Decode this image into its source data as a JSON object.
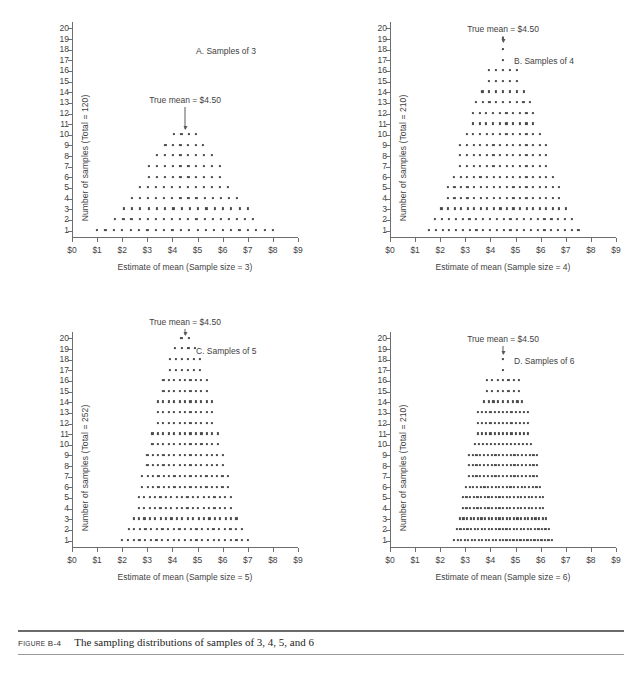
{
  "caption": {
    "figure_number_prefix": "F",
    "figure_number_small": "IGURE",
    "figure_number_id": " B-4",
    "text": "The sampling distributions of samples of 3, 4, 5, and 6"
  },
  "axes_common": {
    "ylabel_prefix": "Number of samples (Total = ",
    "ylabel_suffix": ")",
    "xlabel_prefix": "Estimate of mean (Sample size = ",
    "xlabel_suffix": ")",
    "x_tick_labels": [
      "$0",
      "$1",
      "$2",
      "$3",
      "$4",
      "$5",
      "$6",
      "$7",
      "$8",
      "$9"
    ],
    "y_tick_labels": [
      "1",
      "2",
      "3",
      "4",
      "5",
      "6",
      "7",
      "8",
      "9",
      "10",
      "11",
      "12",
      "13",
      "14",
      "15",
      "16",
      "17",
      "18",
      "19",
      "20"
    ],
    "mean_annotation": "True mean = $4.50",
    "true_mean_value": 4.5,
    "dot_color": "#4a4a4a",
    "axis_color": "#6e6e6e",
    "text_color": "#3f3f3f"
  },
  "chart_data": [
    {
      "type": "scatter",
      "panel": "A",
      "title": "A. Samples of 3",
      "sample_size": 3,
      "total": 120,
      "xlabel": "Estimate of mean (Sample size = 3)",
      "ylabel": "Number of samples (Total = 120)",
      "xlim": [
        0,
        9
      ],
      "ylim": [
        0.3,
        20.6
      ],
      "grid": false,
      "annotation": "True mean = $4.50",
      "annotation_x": 4.5,
      "annotation_y": 13.7,
      "rows": [
        {
          "y": 1,
          "count": 22,
          "x_start": 1.0,
          "x_end": 8.0
        },
        {
          "y": 2,
          "count": 18,
          "x_start": 1.72,
          "x_end": 7.22
        },
        {
          "y": 3,
          "count": 16,
          "x_start": 2.06,
          "x_end": 7.0
        },
        {
          "y": 4,
          "count": 14,
          "x_start": 2.39,
          "x_end": 6.56
        },
        {
          "y": 5,
          "count": 12,
          "x_start": 2.72,
          "x_end": 6.22
        },
        {
          "y": 6,
          "count": 10,
          "x_start": 3.06,
          "x_end": 5.89
        },
        {
          "y": 7,
          "count": 10,
          "x_start": 3.06,
          "x_end": 5.89
        },
        {
          "y": 8,
          "count": 8,
          "x_start": 3.39,
          "x_end": 5.56
        },
        {
          "y": 9,
          "count": 6,
          "x_start": 3.72,
          "x_end": 5.22
        },
        {
          "y": 10,
          "count": 4,
          "x_start": 4.06,
          "x_end": 4.94
        }
      ]
    },
    {
      "type": "scatter",
      "panel": "B",
      "title": "B. Samples of 4",
      "sample_size": 4,
      "total": 210,
      "xlabel": "Estimate of mean (Sample size = 4)",
      "ylabel": "Number of samples (Total = 210)",
      "xlim": [
        0,
        9
      ],
      "ylim": [
        0.3,
        20.6
      ],
      "grid": false,
      "annotation": "True mean = $4.50",
      "annotation_x": 4.5,
      "annotation_y": 20.4,
      "rows": [
        {
          "y": 1,
          "count": 23,
          "x_start": 1.55,
          "x_end": 7.5
        },
        {
          "y": 2,
          "count": 21,
          "x_start": 1.8,
          "x_end": 7.24
        },
        {
          "y": 3,
          "count": 20,
          "x_start": 2.05,
          "x_end": 7.0
        },
        {
          "y": 4,
          "count": 18,
          "x_start": 2.3,
          "x_end": 6.74
        },
        {
          "y": 5,
          "count": 18,
          "x_start": 2.3,
          "x_end": 6.74
        },
        {
          "y": 6,
          "count": 16,
          "x_start": 2.55,
          "x_end": 6.48
        },
        {
          "y": 7,
          "count": 14,
          "x_start": 2.8,
          "x_end": 6.22
        },
        {
          "y": 8,
          "count": 14,
          "x_start": 2.8,
          "x_end": 6.22
        },
        {
          "y": 9,
          "count": 14,
          "x_start": 2.8,
          "x_end": 6.22
        },
        {
          "y": 10,
          "count": 12,
          "x_start": 3.05,
          "x_end": 5.96
        },
        {
          "y": 11,
          "count": 10,
          "x_start": 3.3,
          "x_end": 5.7
        },
        {
          "y": 12,
          "count": 10,
          "x_start": 3.3,
          "x_end": 5.7
        },
        {
          "y": 13,
          "count": 9,
          "x_start": 3.42,
          "x_end": 5.58
        },
        {
          "y": 14,
          "count": 7,
          "x_start": 3.68,
          "x_end": 5.32
        },
        {
          "y": 15,
          "count": 5,
          "x_start": 3.94,
          "x_end": 5.06
        },
        {
          "y": 16,
          "count": 5,
          "x_start": 3.94,
          "x_end": 5.06
        },
        {
          "y": 17,
          "count": 1,
          "x_start": 4.5,
          "x_end": 4.5
        },
        {
          "y": 18,
          "count": 1,
          "x_start": 4.5,
          "x_end": 4.5
        },
        {
          "y": 19,
          "count": 1,
          "x_start": 4.5,
          "x_end": 4.5
        }
      ]
    },
    {
      "type": "scatter",
      "panel": "C",
      "title": "C. Samples of 5",
      "sample_size": 5,
      "total": 252,
      "xlabel": "Estimate of mean (Sample size = 5)",
      "ylabel": "Number of samples (Total = 252)",
      "xlim": [
        0,
        9
      ],
      "ylim": [
        0.3,
        20.6
      ],
      "grid": false,
      "annotation": "True mean = $4.50",
      "annotation_x": 4.5,
      "annotation_y": 22.0,
      "rows": [
        {
          "y": 1,
          "count": 23,
          "x_start": 2.0,
          "x_end": 7.0
        },
        {
          "y": 2,
          "count": 21,
          "x_start": 2.25,
          "x_end": 6.76
        },
        {
          "y": 3,
          "count": 20,
          "x_start": 2.45,
          "x_end": 6.55
        },
        {
          "y": 4,
          "count": 18,
          "x_start": 2.66,
          "x_end": 6.32
        },
        {
          "y": 5,
          "count": 18,
          "x_start": 2.66,
          "x_end": 6.32
        },
        {
          "y": 6,
          "count": 17,
          "x_start": 2.8,
          "x_end": 6.2
        },
        {
          "y": 7,
          "count": 17,
          "x_start": 2.8,
          "x_end": 6.2
        },
        {
          "y": 8,
          "count": 15,
          "x_start": 3.0,
          "x_end": 6.0
        },
        {
          "y": 9,
          "count": 15,
          "x_start": 3.0,
          "x_end": 6.0
        },
        {
          "y": 10,
          "count": 13,
          "x_start": 3.2,
          "x_end": 5.8
        },
        {
          "y": 11,
          "count": 13,
          "x_start": 3.2,
          "x_end": 5.8
        },
        {
          "y": 12,
          "count": 11,
          "x_start": 3.42,
          "x_end": 5.58
        },
        {
          "y": 13,
          "count": 11,
          "x_start": 3.42,
          "x_end": 5.58
        },
        {
          "y": 14,
          "count": 11,
          "x_start": 3.42,
          "x_end": 5.58
        },
        {
          "y": 15,
          "count": 9,
          "x_start": 3.64,
          "x_end": 5.36
        },
        {
          "y": 16,
          "count": 9,
          "x_start": 3.64,
          "x_end": 5.36
        },
        {
          "y": 17,
          "count": 6,
          "x_start": 3.9,
          "x_end": 5.1
        },
        {
          "y": 18,
          "count": 6,
          "x_start": 3.9,
          "x_end": 5.1
        },
        {
          "y": 19,
          "count": 4,
          "x_start": 4.1,
          "x_end": 4.9
        },
        {
          "y": 20,
          "count": 2,
          "x_start": 4.36,
          "x_end": 4.64
        }
      ]
    },
    {
      "type": "scatter",
      "panel": "D",
      "title": "D. Samples of 6",
      "sample_size": 6,
      "total": 210,
      "xlabel": "Estimate of mean (Sample size = 6)",
      "ylabel": "Number of samples (Total = 210)",
      "xlim": [
        0,
        9
      ],
      "ylim": [
        0.3,
        20.6
      ],
      "grid": false,
      "annotation": "True mean = $4.50",
      "annotation_x": 4.5,
      "annotation_y": 20.4,
      "rows": [
        {
          "y": 1,
          "count": 29,
          "x_start": 2.55,
          "x_end": 6.45
        },
        {
          "y": 2,
          "count": 27,
          "x_start": 2.66,
          "x_end": 6.33
        },
        {
          "y": 3,
          "count": 25,
          "x_start": 2.78,
          "x_end": 6.22
        },
        {
          "y": 4,
          "count": 23,
          "x_start": 2.9,
          "x_end": 6.1
        },
        {
          "y": 5,
          "count": 23,
          "x_start": 2.9,
          "x_end": 6.1
        },
        {
          "y": 6,
          "count": 21,
          "x_start": 3.02,
          "x_end": 5.98
        },
        {
          "y": 7,
          "count": 19,
          "x_start": 3.14,
          "x_end": 5.86
        },
        {
          "y": 8,
          "count": 19,
          "x_start": 3.14,
          "x_end": 5.86
        },
        {
          "y": 9,
          "count": 19,
          "x_start": 3.14,
          "x_end": 5.86
        },
        {
          "y": 10,
          "count": 15,
          "x_start": 3.38,
          "x_end": 5.62
        },
        {
          "y": 11,
          "count": 13,
          "x_start": 3.5,
          "x_end": 5.5
        },
        {
          "y": 12,
          "count": 13,
          "x_start": 3.5,
          "x_end": 5.5
        },
        {
          "y": 13,
          "count": 13,
          "x_start": 3.5,
          "x_end": 5.5
        },
        {
          "y": 14,
          "count": 9,
          "x_start": 3.74,
          "x_end": 5.26
        },
        {
          "y": 15,
          "count": 7,
          "x_start": 3.86,
          "x_end": 5.14
        },
        {
          "y": 16,
          "count": 7,
          "x_start": 3.86,
          "x_end": 5.14
        },
        {
          "y": 17,
          "count": 1,
          "x_start": 4.5,
          "x_end": 4.5
        },
        {
          "y": 18,
          "count": 1,
          "x_start": 4.5,
          "x_end": 4.5
        }
      ]
    }
  ]
}
